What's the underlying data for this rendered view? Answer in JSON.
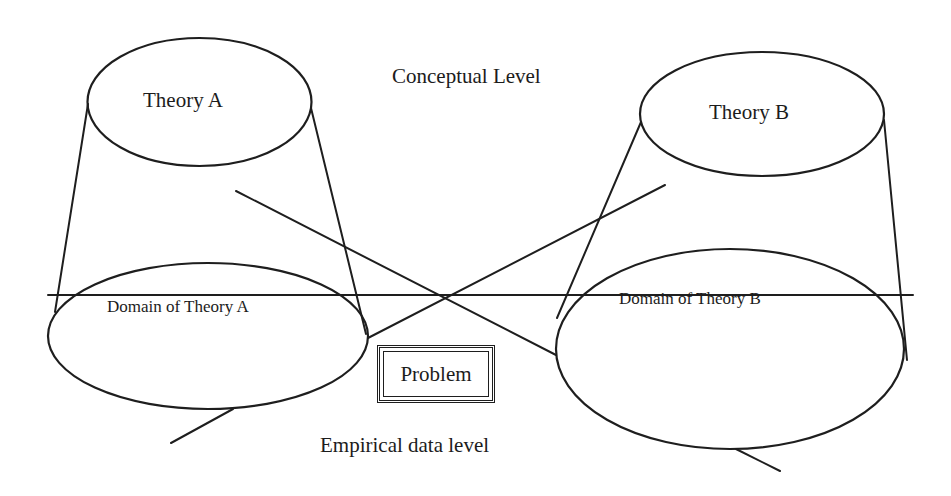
{
  "diagram": {
    "levels": {
      "conceptual": "Conceptual Level",
      "empirical": "Empirical data level"
    },
    "theories": [
      {
        "id": "A",
        "label": "Theory A",
        "domain_label": "Domain of Theory A"
      },
      {
        "id": "B",
        "label": "Theory B",
        "domain_label": "Domain of Theory B"
      }
    ],
    "problem": {
      "label": "Problem"
    },
    "colors": {
      "stroke": "#1e1e1e",
      "background": "#ffffff",
      "text": "#1c1c1c"
    }
  }
}
